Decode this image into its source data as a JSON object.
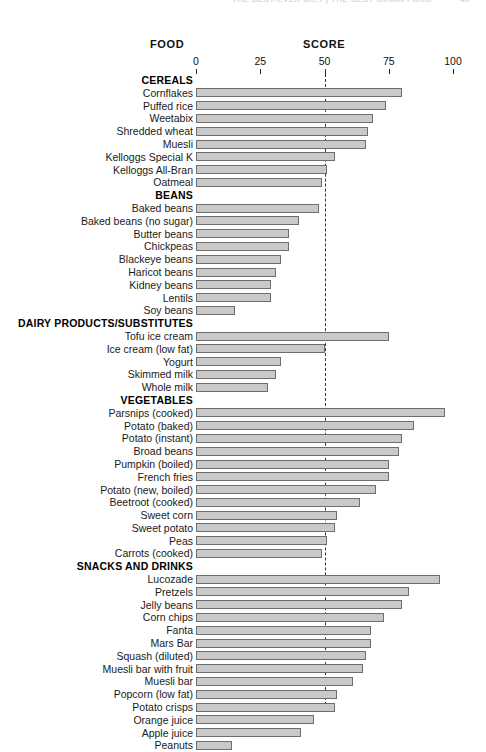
{
  "running_head": {
    "text": "THE BEST-EVER DIET | THE BEST GRAIN FOOD",
    "page_number": "45"
  },
  "headings": {
    "food": "FOOD",
    "score": "SCORE"
  },
  "chart_data": {
    "type": "bar",
    "orientation": "horizontal",
    "title": "",
    "xlabel": "SCORE",
    "ylabel": "FOOD",
    "xlim": [
      0,
      100
    ],
    "xticks": [
      0,
      25,
      50,
      75,
      100
    ],
    "xtick_labels": [
      "0",
      "25",
      "50",
      "75",
      "100"
    ],
    "grid": false,
    "legend": null,
    "reference_line": {
      "value": 50,
      "style": "dashed"
    },
    "bar_fill": "#c9c9c9",
    "bar_stroke": "#6e6e6e",
    "groups": [
      {
        "name": "CEREALS",
        "items": [
          {
            "label": "Cornflakes",
            "value": 80
          },
          {
            "label": "Puffed rice",
            "value": 74
          },
          {
            "label": "Weetabix",
            "value": 69
          },
          {
            "label": "Shredded wheat",
            "value": 67
          },
          {
            "label": "Muesli",
            "value": 66
          },
          {
            "label": "Kelloggs Special K",
            "value": 54
          },
          {
            "label": "Kelloggs All-Bran",
            "value": 51
          },
          {
            "label": "Oatmeal",
            "value": 49
          }
        ]
      },
      {
        "name": "BEANS",
        "items": [
          {
            "label": "Baked beans",
            "value": 48
          },
          {
            "label": "Baked beans (no sugar)",
            "value": 40
          },
          {
            "label": "Butter beans",
            "value": 36
          },
          {
            "label": "Chickpeas",
            "value": 36
          },
          {
            "label": "Blackeye beans",
            "value": 33
          },
          {
            "label": "Haricot beans",
            "value": 31
          },
          {
            "label": "Kidney beans",
            "value": 29
          },
          {
            "label": "Lentils",
            "value": 29
          },
          {
            "label": "Soy beans",
            "value": 15
          }
        ]
      },
      {
        "name": "DAIRY PRODUCTS/SUBSTITUTES",
        "items": [
          {
            "label": "Tofu ice cream",
            "value": 75
          },
          {
            "label": "Ice cream (low fat)",
            "value": 50
          },
          {
            "label": "Yogurt",
            "value": 33
          },
          {
            "label": "Skimmed milk",
            "value": 31
          },
          {
            "label": "Whole milk",
            "value": 28
          }
        ]
      },
      {
        "name": "VEGETABLES",
        "items": [
          {
            "label": "Parsnips (cooked)",
            "value": 97
          },
          {
            "label": "Potato (baked)",
            "value": 85
          },
          {
            "label": "Potato (instant)",
            "value": 80
          },
          {
            "label": "Broad beans",
            "value": 79
          },
          {
            "label": "Pumpkin (boiled)",
            "value": 75
          },
          {
            "label": "French fries",
            "value": 75
          },
          {
            "label": "Potato (new, boiled)",
            "value": 70
          },
          {
            "label": "Beetroot (cooked)",
            "value": 64
          },
          {
            "label": "Sweet corn",
            "value": 55
          },
          {
            "label": "Sweet potato",
            "value": 54
          },
          {
            "label": "Peas",
            "value": 51
          },
          {
            "label": "Carrots (cooked)",
            "value": 49
          }
        ]
      },
      {
        "name": "SNACKS AND DRINKS",
        "items": [
          {
            "label": "Lucozade",
            "value": 95
          },
          {
            "label": "Pretzels",
            "value": 83
          },
          {
            "label": "Jelly beans",
            "value": 80
          },
          {
            "label": "Corn chips",
            "value": 73
          },
          {
            "label": "Fanta",
            "value": 68
          },
          {
            "label": "Mars Bar",
            "value": 68
          },
          {
            "label": "Squash (diluted)",
            "value": 66
          },
          {
            "label": "Muesli bar with fruit",
            "value": 65
          },
          {
            "label": "Muesli bar",
            "value": 61
          },
          {
            "label": "Popcorn (low fat)",
            "value": 55
          },
          {
            "label": "Potato crisps",
            "value": 54
          },
          {
            "label": "Orange juice",
            "value": 46
          },
          {
            "label": "Apple juice",
            "value": 41
          },
          {
            "label": "Peanuts",
            "value": 14
          }
        ]
      }
    ]
  }
}
